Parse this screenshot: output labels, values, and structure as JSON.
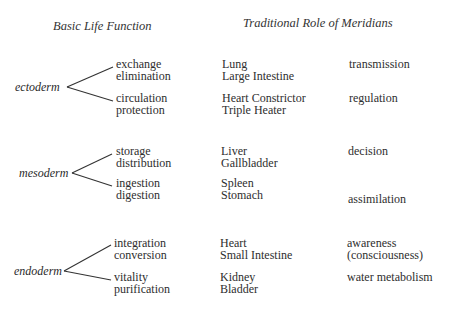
{
  "headers": {
    "basic_life_function": "Basic Life Function",
    "traditional_role": "Traditional Role of Meridians"
  },
  "groups": [
    {
      "germ_layer": "ectoderm",
      "functions": [
        "exchange",
        "elimination",
        "circulation",
        "protection"
      ],
      "meridians": [
        "Lung",
        "Large Intestine",
        "Heart Constrictor",
        "Triple Heater"
      ],
      "roles": [
        "transmission",
        "regulation"
      ]
    },
    {
      "germ_layer": "mesoderm",
      "functions": [
        "storage",
        "distribution",
        "ingestion",
        "digestion"
      ],
      "meridians": [
        "Liver",
        "Gallbladder",
        "Spleen",
        "Stomach"
      ],
      "roles": [
        "decision",
        "assimilation"
      ]
    },
    {
      "germ_layer": "endoderm",
      "functions": [
        "integration",
        "conversion",
        "vitality",
        "purification"
      ],
      "meridians": [
        "Heart",
        "Small Intestine",
        "Kidney",
        "Bladder"
      ],
      "roles": [
        "awareness",
        "(consciousness)",
        "water metabolism"
      ]
    }
  ]
}
